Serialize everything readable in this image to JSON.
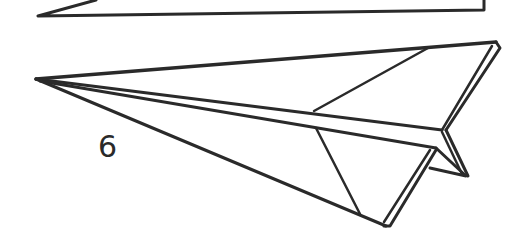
{
  "diagram": {
    "step_label": "6",
    "colors": {
      "line": "#2a2a2a",
      "background": "#ffffff"
    }
  }
}
